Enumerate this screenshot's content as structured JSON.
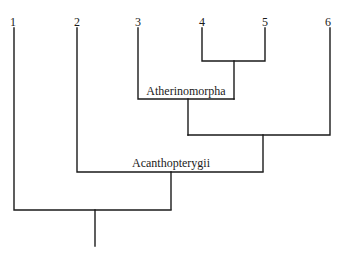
{
  "diagram": {
    "type": "cladogram",
    "line_color": "#1a1a1a",
    "taxa": [
      {
        "id": "1",
        "label": "1"
      },
      {
        "id": "2",
        "label": "2"
      },
      {
        "id": "3",
        "label": "3"
      },
      {
        "id": "4",
        "label": "4"
      },
      {
        "id": "5",
        "label": "5"
      },
      {
        "id": "6",
        "label": "6"
      }
    ],
    "clades": [
      {
        "name": "Atherinomorpha",
        "members": [
          "3",
          "4",
          "5"
        ]
      },
      {
        "name": "Acanthopterygii",
        "members": [
          "2",
          "3",
          "4",
          "5",
          "6"
        ]
      }
    ],
    "topology": "(1,(2,((3,(4,5)),6)))"
  }
}
